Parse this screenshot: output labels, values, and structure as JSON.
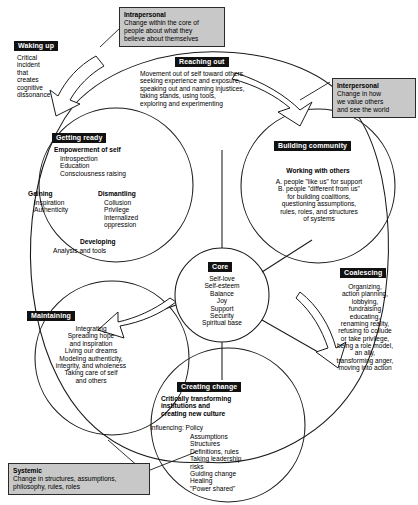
{
  "diagram": {
    "core": {
      "banner": "Core",
      "items": "Self-love\nSelf-esteem\nBalance\nJoy\nSupport\nSecurity\nSpiritual base"
    },
    "petals": [
      {
        "id": "getting-ready",
        "banner": "Getting ready",
        "heading": "Empowerment of self",
        "body": "Introspection\nEducation\nConsciousness raising",
        "col_left_heading": "Gaining",
        "col_left_body": "Inspiration\nAuthenticity",
        "col_right_heading": "Dismantling",
        "col_right_body": "Collusion\nPrivilege\nInternalized\noppression",
        "bottom_heading": "Developing",
        "bottom_body": "Analysis and tools"
      },
      {
        "id": "building-community",
        "banner": "Building community",
        "heading": "Working with others",
        "body": "A. people \"like us\" for support\nB. people \"different from us\"\nfor building coalitions,\nquestioning assumptions,\nrules, roles, and structures\nof systems"
      },
      {
        "id": "creating-change",
        "banner": "Creating change",
        "heading": "Critically transforming\ninstitutions and\ncreating new culture",
        "body_lead": "Influencing: Policy",
        "body": "Assumptions\nStructures\nDefinitions, rules\nTaking leadership\nrisks\nGuiding change\nHealing\n\"Power shared\""
      },
      {
        "id": "maintaining",
        "banner": "Maintaining",
        "body": "Integrating\nSpreading hope\nand inspiration\nLiving our dreams\nModeling authenticity,\nintegrity, and wholeness\nTaking care of self\nand others"
      }
    ],
    "spokes": [
      {
        "id": "waking-up",
        "banner": "Waking up",
        "body": "Critical\nincident\nthat\ncreates\ncognitive\ndissonance"
      },
      {
        "id": "reaching-out",
        "banner": "Reaching out",
        "body": "Movement out of self toward others\nseeking experience and exposure,\nspeaking out and naming injustices,\ntaking stands, using tools,\nexploring and experimenting"
      },
      {
        "id": "coalescing",
        "banner": "Coalescing",
        "body": "Organizing,\naction planning,\nlobbying,\nfundraising\neducating,\nrenaming reality,\nrefusing to collude\nor take privilege,\nbeing a role model,\nan ally,\ntransforming anger,\nmoving into action"
      }
    ],
    "callouts": [
      {
        "id": "intrapersonal",
        "heading": "Intrapersonal",
        "body": "Change within the core of\n  people about what they\n  believe about themselves"
      },
      {
        "id": "interpersonal",
        "heading": "Interpersonal",
        "body": "Change in how\n  we value others\n  and see the world"
      },
      {
        "id": "systemic",
        "heading": "Systemic",
        "body": "Change in structures, assumptions,\nphilosophy, rules, roles"
      }
    ],
    "colors": {
      "banner_bg": "#111111",
      "banner_fg": "#ffffff",
      "callout_bg": "#c8c8c8",
      "stroke": "#1a1a1a",
      "page_bg": "#ffffff"
    }
  }
}
